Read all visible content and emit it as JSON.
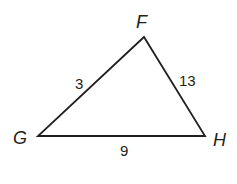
{
  "diagram": {
    "type": "triangle",
    "vertices": [
      {
        "name": "F",
        "x": 144,
        "y": 37
      },
      {
        "name": "G",
        "x": 38,
        "y": 136
      },
      {
        "name": "H",
        "x": 205,
        "y": 136
      }
    ],
    "vertex_labels": {
      "F": "F",
      "G": "G",
      "H": "H"
    },
    "side_labels": {
      "FG": "3",
      "FH": "13",
      "GH": "9"
    },
    "stroke_color": "#231f20",
    "background": "#ffffff"
  }
}
